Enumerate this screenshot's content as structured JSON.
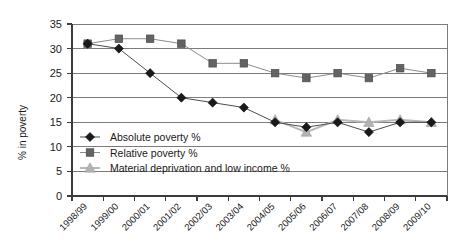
{
  "chart_data": {
    "type": "line",
    "title": "",
    "xlabel": "",
    "ylabel": "% in poverty",
    "ylim": [
      0,
      35
    ],
    "ytick_step": 5,
    "grid": true,
    "legend_position": "inside-lower-left",
    "categories": [
      "1998/99",
      "1999/00",
      "2000/01",
      "2001/02",
      "2002/03",
      "2003/04",
      "2004/05",
      "2005/06",
      "2006/07",
      "2007/08",
      "2008/09",
      "2009/10"
    ],
    "yticks": [
      "0",
      "5",
      "10",
      "15",
      "20",
      "25",
      "30",
      "35"
    ],
    "series": [
      {
        "name": "Absolute poverty %",
        "marker": "diamond",
        "color": "#1a1a1a",
        "line_color": "#4d4d4d",
        "values": [
          31,
          30,
          25,
          20,
          19,
          18,
          15,
          14,
          15,
          13,
          15,
          15
        ]
      },
      {
        "name": "Relative poverty %",
        "marker": "square",
        "color": "#636363",
        "line_color": "#8c8c8c",
        "values": [
          31,
          32,
          32,
          31,
          27,
          27,
          25,
          24,
          25,
          24,
          26,
          25
        ]
      },
      {
        "name": "Material deprivation and low income %",
        "marker": "triangle",
        "color": "#b3b3b3",
        "line_color": "#b8b8b8",
        "values": [
          null,
          null,
          null,
          null,
          null,
          null,
          15.5,
          13,
          15.5,
          15,
          15.5,
          15
        ]
      }
    ]
  },
  "legend": {
    "items": [
      {
        "label": "Absolute poverty %"
      },
      {
        "label": "Relative poverty %"
      },
      {
        "label": "Material deprivation and low income %"
      }
    ]
  },
  "axes": {
    "y_title": "% in poverty"
  }
}
